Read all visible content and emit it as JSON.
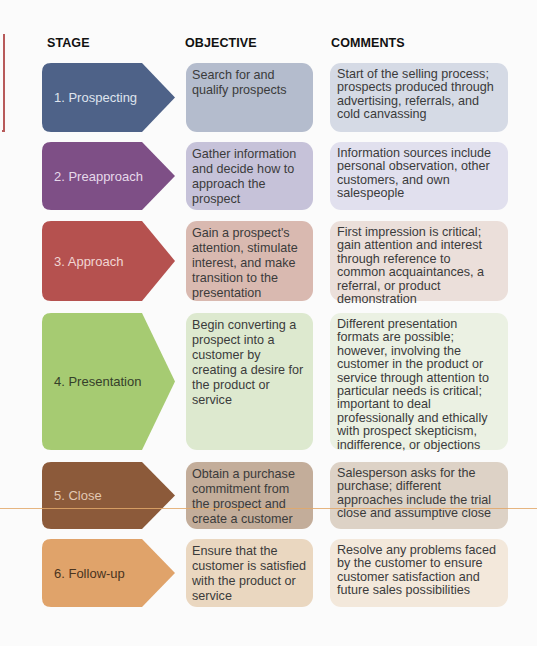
{
  "headers": {
    "stage": "STAGE",
    "objective": "OBJECTIVE",
    "comments": "COMMENTS"
  },
  "colors": {
    "accent_bracket": "#b85a5a"
  },
  "rows": [
    {
      "stage": "1. Prospecting",
      "objective": "Search for and qualify prospects",
      "comments": "Start of the selling process; prospects produced through advertising, referrals, and cold canvassing",
      "stage_color": "#4e6288",
      "stage_text_color": "#dfe4ee",
      "objective_color": "#b4bccd",
      "comments_color": "#d5dae5"
    },
    {
      "stage": "2. Preapproach",
      "objective": "Gather information and decide how to approach the prospect",
      "comments": "Information sources include personal observation, other customers, and own salespeople",
      "stage_color": "#7e4f86",
      "stage_text_color": "#e6d9ea",
      "objective_color": "#c6c2d9",
      "comments_color": "#e1e0ee"
    },
    {
      "stage": "3. Approach",
      "objective": "Gain a prospect's attention, stimulate interest, and make transition to the presentation",
      "comments": "First impression is critical; gain attention and interest through reference to common acquaintances, a referral, or product demonstration",
      "stage_color": "#b5514f",
      "stage_text_color": "#f1d6d3",
      "objective_color": "#d9b9b0",
      "comments_color": "#ebdfda"
    },
    {
      "stage": "4. Presentation",
      "objective": "Begin converting a prospect into a customer by creating a desire for the product or service",
      "comments": "Different presentation formats are possible; however, involving the customer in the product or service through attention to particular needs is critical; important to deal professionally and ethically with prospect skepticism, indifference, or objections",
      "stage_color": "#a6cb72",
      "stage_text_color": "#35402a",
      "objective_color": "#dde9cf",
      "comments_color": "#ebf1e3"
    },
    {
      "stage": "5. Close",
      "objective": "Obtain a purchase commitment from the prospect and create a customer",
      "comments": "Salesperson asks for the purchase; different approaches include the trial close and assumptive close",
      "stage_color": "#8c5a3a",
      "stage_text_color": "#e2c9b4",
      "objective_color": "#c3ad9a",
      "comments_color": "#ddd2c6"
    },
    {
      "stage": "6. Follow-up",
      "objective": "Ensure that the customer is satisfied with the product or service",
      "comments": "Resolve any problems faced by the customer to ensure customer satisfaction and future sales possibilities",
      "stage_color": "#e0a36a",
      "stage_text_color": "#4a3420",
      "objective_color": "#ead7c0",
      "comments_color": "#f3e8db"
    }
  ]
}
